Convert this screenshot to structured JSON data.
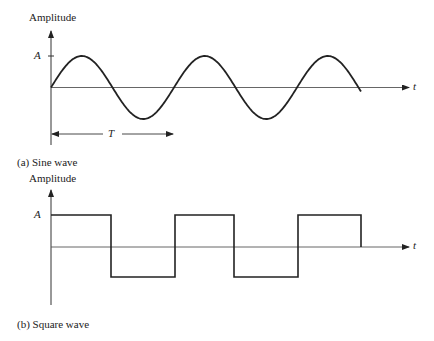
{
  "chart_data": [
    {
      "type": "line",
      "title": "(a) Sine wave",
      "ylabel": "Amplitude",
      "xlabel": "t",
      "y_tick_labels": [
        "A"
      ],
      "annotations": [
        {
          "label": "T",
          "meaning": "period, arrow spanning one full cycle"
        }
      ],
      "cycles_shown": 2.5,
      "amplitude": "A",
      "grid": false
    },
    {
      "type": "line",
      "title": "(b) Square wave",
      "ylabel": "Amplitude",
      "xlabel": "t",
      "y_tick_labels": [
        "A"
      ],
      "levels": [
        "A",
        "-A"
      ],
      "cycles_shown": 2.5,
      "grid": false
    }
  ],
  "sine": {
    "ylabel": "Amplitude",
    "a_label": "A",
    "t_label": "t",
    "period_label": "T",
    "caption": "(a) Sine wave"
  },
  "square": {
    "ylabel": "Amplitude",
    "a_label": "A",
    "t_label": "t",
    "caption": "(b) Square wave"
  }
}
